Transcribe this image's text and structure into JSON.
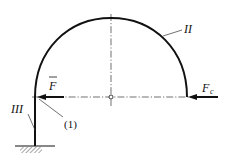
{
  "diagram": {
    "type": "mechanics-structure",
    "labels": {
      "arch": "II",
      "post": "III",
      "point_1": "(1)",
      "force_f": "F",
      "force_fc_main": "F",
      "force_fc_sub": "c"
    },
    "elements": [
      {
        "name": "semicircular-arch",
        "label": "II"
      },
      {
        "name": "vertical-post",
        "label": "III"
      },
      {
        "name": "fixed-support",
        "label": ""
      },
      {
        "name": "force-arrow-f",
        "label": "F̄",
        "direction": "left"
      },
      {
        "name": "force-arrow-fc",
        "label": "Fc",
        "direction": "left"
      },
      {
        "name": "joint-point",
        "label": "(1)"
      },
      {
        "name": "center-point",
        "label": ""
      }
    ],
    "colors": {
      "stroke": "#111111",
      "background": "#ffffff"
    }
  }
}
